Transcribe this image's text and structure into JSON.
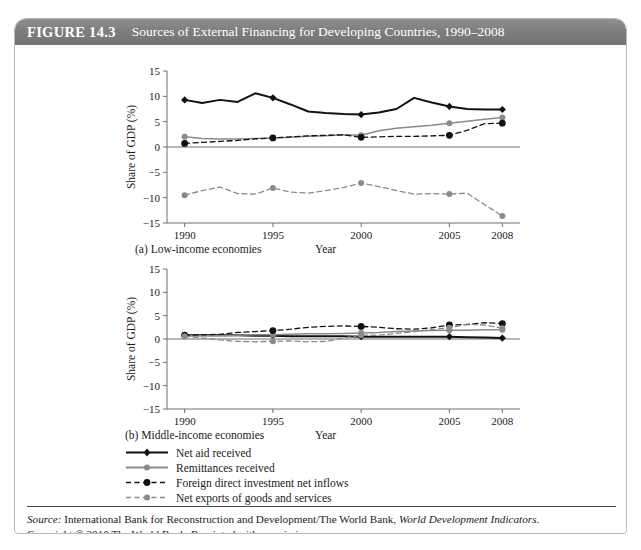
{
  "figure": {
    "number": "FIGURE 14.3",
    "title": "Sources of External Financing for Developing Countries, 1990–2008"
  },
  "source": {
    "label": "Source:",
    "text_before_italic": " International Bank for Reconstruction and Development/The World Bank, ",
    "italic_title": "World Development Indicators",
    "text_after_italic": ".",
    "copyright": "Copyright © 2010 The World Bank. Reprinted with permission."
  },
  "legend": {
    "items": [
      {
        "label": "Net aid received",
        "style": "solid",
        "color": "#111111",
        "marker": "diamond"
      },
      {
        "label": "Remittances received",
        "style": "solid",
        "color": "#8a8a8a",
        "marker": "circle"
      },
      {
        "label": "Foreign direct investment net inflows",
        "style": "dashed",
        "color": "#111111",
        "marker": "circle"
      },
      {
        "label": "Net exports of goods and services",
        "style": "dashed",
        "color": "#8a8a8a",
        "marker": "circle"
      }
    ]
  },
  "colors": {
    "black_series": "#111111",
    "grey_series": "#8a8a8a",
    "axis": "#6f6f6f",
    "header_bar": "#7e7e7e",
    "panel_border": "#b9b9b9"
  },
  "chart_data": [
    {
      "type": "line",
      "title": "(a) Low-income economies",
      "panel_label": "(a) Low-income economies",
      "xlabel": "Year",
      "ylabel": "Share of GDP (%)",
      "xlim": [
        1989,
        2009
      ],
      "ylim": [
        -15,
        15
      ],
      "yticks": [
        -15,
        -10,
        -5,
        0,
        5,
        10,
        15
      ],
      "ytick_labels": [
        "−15",
        "−10",
        "−5",
        "0",
        "5",
        "10",
        "15"
      ],
      "xticks": [
        1990,
        1995,
        2000,
        2005,
        2008
      ],
      "xtick_labels": [
        "1990",
        "1995",
        "2000",
        "2005",
        "2008"
      ],
      "grid": false,
      "legend_position": "below-figure",
      "x": [
        1990,
        1991,
        1992,
        1993,
        1994,
        1995,
        1996,
        1997,
        1998,
        1999,
        2000,
        2001,
        2002,
        2003,
        2004,
        2005,
        2006,
        2007,
        2008
      ],
      "series": [
        {
          "name": "Net aid received",
          "style": "solid",
          "color": "#111111",
          "marker": "diamond",
          "marked_x": [
            1990,
            1995,
            2000,
            2005,
            2008
          ],
          "values": [
            9.3,
            8.7,
            9.3,
            8.9,
            10.6,
            9.7,
            8.4,
            7.0,
            6.7,
            6.5,
            6.4,
            6.8,
            7.5,
            9.7,
            8.8,
            8.0,
            7.5,
            7.4,
            7.4
          ]
        },
        {
          "name": "Remittances received",
          "style": "solid",
          "color": "#8a8a8a",
          "marker": "circle",
          "marked_x": [
            1990,
            1995,
            2000,
            2005,
            2008
          ],
          "values": [
            2.0,
            1.7,
            1.6,
            1.6,
            1.7,
            1.8,
            1.9,
            2.1,
            2.2,
            2.4,
            2.3,
            3.2,
            3.7,
            4.0,
            4.3,
            4.7,
            5.1,
            5.5,
            5.8
          ]
        },
        {
          "name": "Foreign direct investment net inflows",
          "style": "dashed",
          "color": "#111111",
          "marker": "circle",
          "marked_x": [
            1990,
            1995,
            2000,
            2005,
            2008
          ],
          "values": [
            0.7,
            0.9,
            1.1,
            1.3,
            1.6,
            1.8,
            2.0,
            2.2,
            2.3,
            2.4,
            1.9,
            2.0,
            2.1,
            2.1,
            2.2,
            2.3,
            3.3,
            4.6,
            4.7
          ]
        },
        {
          "name": "Net exports of goods and services",
          "style": "dashed",
          "color": "#8a8a8a",
          "marker": "circle",
          "marked_x": [
            1990,
            1995,
            2000,
            2005,
            2008
          ],
          "values": [
            -9.5,
            -8.6,
            -7.9,
            -9.2,
            -9.3,
            -8.1,
            -8.9,
            -9.1,
            -8.6,
            -8.0,
            -7.1,
            -7.8,
            -8.6,
            -9.3,
            -9.2,
            -9.3,
            -9.1,
            -11.4,
            -13.6
          ]
        }
      ]
    },
    {
      "type": "line",
      "title": "(b) Middle-income economies",
      "panel_label": "(b) Middle-income economies",
      "xlabel": "Year",
      "ylabel": "Share of GDP (%)",
      "xlim": [
        1989,
        2009
      ],
      "ylim": [
        -15,
        15
      ],
      "yticks": [
        -15,
        -10,
        -5,
        0,
        5,
        10,
        15
      ],
      "ytick_labels": [
        "−15",
        "−10",
        "−5",
        "0",
        "5",
        "10",
        "15"
      ],
      "xticks": [
        1990,
        1995,
        2000,
        2005,
        2008
      ],
      "xtick_labels": [
        "1990",
        "1995",
        "2000",
        "2005",
        "2008"
      ],
      "grid": false,
      "legend_position": "below-figure",
      "x": [
        1990,
        1991,
        1992,
        1993,
        1994,
        1995,
        1996,
        1997,
        1998,
        1999,
        2000,
        2001,
        2002,
        2003,
        2004,
        2005,
        2006,
        2007,
        2008
      ],
      "series": [
        {
          "name": "Net aid received",
          "style": "solid",
          "color": "#111111",
          "marker": "diamond",
          "marked_x": [
            1990,
            1995,
            2000,
            2005,
            2008
          ],
          "values": [
            0.8,
            0.8,
            0.8,
            0.8,
            0.7,
            0.7,
            0.6,
            0.6,
            0.6,
            0.6,
            0.5,
            0.5,
            0.5,
            0.5,
            0.5,
            0.5,
            0.4,
            0.3,
            0.2
          ]
        },
        {
          "name": "Remittances received",
          "style": "solid",
          "color": "#8a8a8a",
          "marker": "circle",
          "marked_x": [
            1990,
            1995,
            2000,
            2005,
            2008
          ],
          "values": [
            0.7,
            0.7,
            0.7,
            0.8,
            0.9,
            0.9,
            1.0,
            1.1,
            1.1,
            1.2,
            1.3,
            1.4,
            1.6,
            1.7,
            1.8,
            1.9,
            1.9,
            2.0,
            2.0
          ]
        },
        {
          "name": "Foreign direct investment net inflows",
          "style": "dashed",
          "color": "#111111",
          "marker": "circle",
          "marked_x": [
            1990,
            1995,
            2000,
            2005,
            2008
          ],
          "values": [
            0.8,
            0.9,
            1.0,
            1.4,
            1.6,
            1.8,
            2.1,
            2.5,
            2.7,
            2.8,
            2.7,
            2.5,
            2.2,
            2.1,
            2.4,
            3.0,
            3.1,
            3.5,
            3.3
          ]
        },
        {
          "name": "Net exports of goods and services",
          "style": "dashed",
          "color": "#8a8a8a",
          "marker": "circle",
          "marked_x": [
            1990,
            1995,
            2000,
            2005,
            2008
          ],
          "values": [
            0.6,
            0.2,
            -0.2,
            -0.5,
            -0.6,
            -0.5,
            -0.4,
            -0.6,
            -0.5,
            0.2,
            0.8,
            0.8,
            1.2,
            1.6,
            2.0,
            2.4,
            3.2,
            3.0,
            2.3
          ]
        }
      ]
    }
  ]
}
